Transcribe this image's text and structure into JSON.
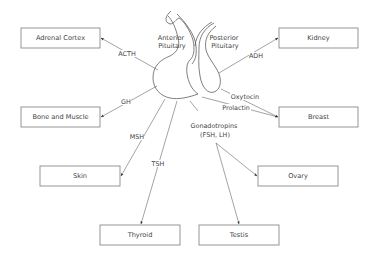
{
  "regions": {
    "anterior": [
      "Anterior",
      "Pituitary"
    ],
    "posterior": [
      "Posterior",
      "Pituitary"
    ]
  },
  "targets": {
    "adrenal_cortex": "Adrenal Cortex",
    "kidney": "Kidney",
    "bone_and_muscle": "Bone and Muscle",
    "breast": "Breast",
    "skin": "Skin",
    "ovary": "Ovary",
    "thyroid": "Thyroid",
    "testis": "Testis"
  },
  "hormones": {
    "acth": "ACTH",
    "adh": "ADH",
    "gh": "GH",
    "oxytocin": "Oxytocin",
    "prolactin": "Prolactin",
    "msh": "MSH",
    "tsh": "TSH",
    "gonadotropins": [
      "Gonadotropins",
      "(FSH, LH)"
    ]
  },
  "connections": [
    {
      "hormone": "ACTH",
      "source": "Anterior Pituitary",
      "target": "Adrenal Cortex"
    },
    {
      "hormone": "ADH",
      "source": "Posterior Pituitary",
      "target": "Kidney"
    },
    {
      "hormone": "GH",
      "source": "Anterior Pituitary",
      "target": "Bone and Muscle"
    },
    {
      "hormone": "Oxytocin",
      "source": "Posterior Pituitary",
      "target": "Breast"
    },
    {
      "hormone": "Prolactin",
      "source": "Anterior Pituitary",
      "target": "Breast"
    },
    {
      "hormone": "MSH",
      "source": "Anterior Pituitary",
      "target": "Skin"
    },
    {
      "hormone": "TSH",
      "source": "Anterior Pituitary",
      "target": "Thyroid"
    },
    {
      "hormone": "Gonadotropins (FSH, LH)",
      "source": "Anterior Pituitary",
      "target": "Ovary"
    },
    {
      "hormone": "Gonadotropins (FSH, LH)",
      "source": "Anterior Pituitary",
      "target": "Testis"
    }
  ]
}
